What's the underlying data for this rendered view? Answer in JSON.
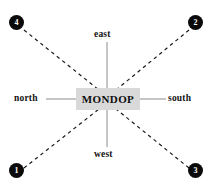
{
  "diagram": {
    "center": {
      "label": "MONDOP",
      "box_color": "#d9d9d9"
    },
    "cardinal_labels": {
      "top": "east",
      "bottom": "west",
      "left": "north",
      "right": "south"
    },
    "nodes": [
      {
        "id": "top-left",
        "label": "4"
      },
      {
        "id": "top-right",
        "label": "2"
      },
      {
        "id": "bottom-left",
        "label": "1"
      },
      {
        "id": "bottom-right",
        "label": "3"
      }
    ],
    "colors": {
      "background": "#ffffff",
      "line": "#8c8c8c",
      "dashed_line": "#1a1a1a",
      "node_fill": "#0a0a0a",
      "node_text": "#ffffff",
      "text": "#121212"
    }
  }
}
